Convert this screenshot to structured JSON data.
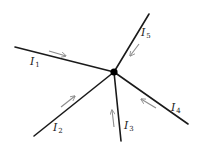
{
  "diagram": {
    "node": {
      "x": 114,
      "y": 72
    },
    "wires": [
      {
        "id": "I1",
        "label": "I",
        "sub": "1",
        "end": [
          15,
          47
        ],
        "label_pos": [
          30,
          65
        ],
        "arrow": {
          "from": [
            49,
            51
          ],
          "to": [
            66,
            56
          ]
        }
      },
      {
        "id": "I5",
        "label": "I",
        "sub": "5",
        "end": [
          149,
          14
        ],
        "label_pos": [
          141,
          36
        ],
        "arrow": {
          "from": [
            139,
            44
          ],
          "to": [
            130,
            56
          ]
        }
      },
      {
        "id": "I4",
        "label": "I",
        "sub": "4",
        "end": [
          188,
          124
        ],
        "label_pos": [
          171,
          111
        ],
        "arrow": {
          "from": [
            156,
            108
          ],
          "to": [
            141,
            99
          ]
        }
      },
      {
        "id": "I3",
        "label": "I",
        "sub": "3",
        "end": [
          121,
          141
        ],
        "label_pos": [
          124,
          129
        ],
        "arrow": {
          "from": [
            114,
            127
          ],
          "to": [
            112,
            110
          ]
        }
      },
      {
        "id": "I2",
        "label": "I",
        "sub": "2",
        "end": [
          34,
          136
        ],
        "label_pos": [
          53,
          131
        ],
        "arrow": {
          "from": [
            61,
            107
          ],
          "to": [
            75,
            96
          ]
        }
      }
    ]
  }
}
